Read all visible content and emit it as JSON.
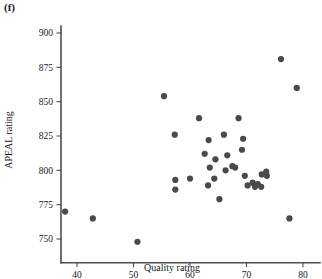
{
  "panel": {
    "label": "(f)"
  },
  "chart_data": {
    "type": "scatter",
    "title": "",
    "panel_label": "(f)",
    "xlabel": "Quality rating",
    "ylabel": "APEAL rating",
    "xlim": [
      34,
      83
    ],
    "ylim": [
      740,
      905
    ],
    "xticks": [
      40,
      50,
      60,
      70,
      80
    ],
    "xticklabels": [
      "40",
      "50",
      "60",
      "70",
      "80"
    ],
    "yticks": [
      750,
      775,
      800,
      825,
      850,
      875,
      900
    ],
    "yticklabels": [
      "750",
      "775",
      "800",
      "825",
      "850",
      "875",
      "900"
    ],
    "grid": false,
    "legend": null,
    "marker": "filled-circle",
    "marker_color": "#4a4a4a",
    "marker_size_px": 3.1,
    "n_points": 36,
    "points": [
      {
        "x": 37.9,
        "y": 770
      },
      {
        "x": 42.8,
        "y": 765
      },
      {
        "x": 50.7,
        "y": 748
      },
      {
        "x": 55.4,
        "y": 854
      },
      {
        "x": 57.3,
        "y": 826
      },
      {
        "x": 57.4,
        "y": 793
      },
      {
        "x": 57.4,
        "y": 786
      },
      {
        "x": 60.0,
        "y": 794
      },
      {
        "x": 61.6,
        "y": 838
      },
      {
        "x": 62.6,
        "y": 812
      },
      {
        "x": 63.2,
        "y": 789
      },
      {
        "x": 63.3,
        "y": 822
      },
      {
        "x": 63.5,
        "y": 802
      },
      {
        "x": 64.3,
        "y": 794
      },
      {
        "x": 64.5,
        "y": 808
      },
      {
        "x": 65.2,
        "y": 779
      },
      {
        "x": 66.0,
        "y": 826
      },
      {
        "x": 66.3,
        "y": 800
      },
      {
        "x": 66.6,
        "y": 811
      },
      {
        "x": 67.5,
        "y": 803
      },
      {
        "x": 68.0,
        "y": 802
      },
      {
        "x": 68.6,
        "y": 838
      },
      {
        "x": 69.2,
        "y": 815
      },
      {
        "x": 69.4,
        "y": 823
      },
      {
        "x": 69.7,
        "y": 796
      },
      {
        "x": 70.2,
        "y": 789
      },
      {
        "x": 71.1,
        "y": 791
      },
      {
        "x": 71.5,
        "y": 788
      },
      {
        "x": 72.0,
        "y": 790
      },
      {
        "x": 72.6,
        "y": 788
      },
      {
        "x": 72.7,
        "y": 797
      },
      {
        "x": 73.5,
        "y": 799
      },
      {
        "x": 73.6,
        "y": 796
      },
      {
        "x": 76.1,
        "y": 881
      },
      {
        "x": 77.6,
        "y": 765
      },
      {
        "x": 78.9,
        "y": 860
      }
    ]
  },
  "axes": {
    "x_title": "Quality rating",
    "y_title": "APEAL rating"
  }
}
